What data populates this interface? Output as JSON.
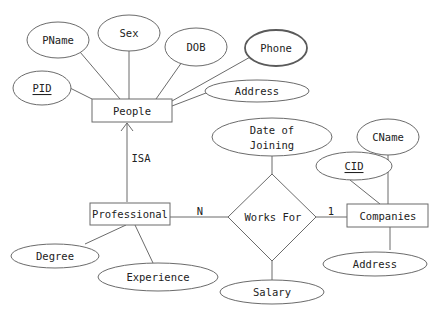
{
  "diagram": {
    "type": "ER diagram",
    "entities": [
      {
        "id": "people",
        "label": "People"
      },
      {
        "id": "professional",
        "label": "Professional"
      },
      {
        "id": "companies",
        "label": "Companies"
      }
    ],
    "relationships": [
      {
        "id": "works_for",
        "label": "Works For",
        "from": "professional",
        "to": "companies",
        "card_from": "N",
        "card_to": "1"
      }
    ],
    "isa": {
      "label": "ISA",
      "child": "professional",
      "parent": "people"
    },
    "attributes": {
      "people": [
        {
          "label": "PID",
          "key": true
        },
        {
          "label": "PName"
        },
        {
          "label": "Sex"
        },
        {
          "label": "DOB"
        },
        {
          "label": "Phone",
          "multivalued": true
        },
        {
          "label": "Address"
        }
      ],
      "professional": [
        {
          "label": "Degree"
        },
        {
          "label": "Experience"
        }
      ],
      "works_for": [
        {
          "label": "Date of Joining",
          "lines": [
            "Date of",
            "Joining"
          ]
        },
        {
          "label": "Salary"
        }
      ],
      "companies": [
        {
          "label": "CID",
          "key": true
        },
        {
          "label": "CName"
        },
        {
          "label": "Address"
        }
      ]
    }
  },
  "labels": {
    "people": "People",
    "professional": "Professional",
    "companies": "Companies",
    "works_for": "Works For",
    "isa": "ISA",
    "card_n": "N",
    "card_1": "1",
    "pid": "PID",
    "pname": "PName",
    "sex": "Sex",
    "dob": "DOB",
    "phone": "Phone",
    "people_address": "Address",
    "degree": "Degree",
    "experience": "Experience",
    "doj_line1": "Date of",
    "doj_line2": "Joining",
    "salary": "Salary",
    "cid": "CID",
    "cname": "CName",
    "companies_address": "Address"
  },
  "colors": {
    "stroke": "#6b6b6b",
    "text": "#222222",
    "background": "#ffffff"
  }
}
